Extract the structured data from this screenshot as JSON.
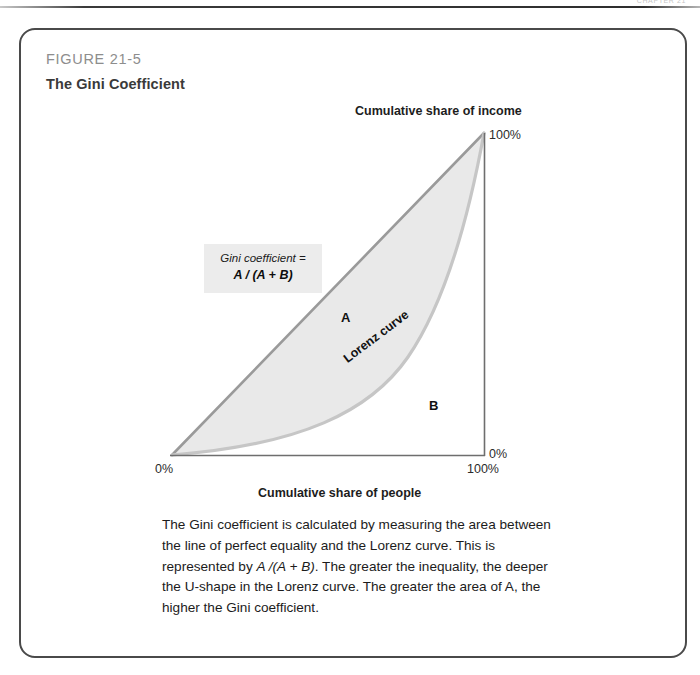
{
  "page": {
    "header_ghost": "CHAPTER 21"
  },
  "figure": {
    "number": "FIGURE 21-5",
    "title": "The Gini Coefficient",
    "caption": "The Gini coefficient  is calculated by measuring the area between the line of perfect equality and the Lorenz curve. This is represented by A /(A + B). The greater the inequality, the deeper the U-shape in the Lorenz curve. The greater the area of A, the higher the Gini coefficient."
  },
  "formula": {
    "label": "Gini coefficient =",
    "expression": "A / (A + B)"
  },
  "annotations": {
    "region_a": "A",
    "region_b": "B",
    "lorenz_curve": "Lorenz curve"
  },
  "colors": {
    "frame": "#4a4a4a",
    "figure_number": "#8d8d8d",
    "figure_title": "#3a3a3a",
    "region_a_fill": "#e9e9e9",
    "equality_line": "#9a9a9a",
    "lorenz_line": "#c4c4c4",
    "axis": "#6e6e6e",
    "formula_box": "#ececec"
  },
  "chart_data": {
    "type": "area",
    "title": "The Gini Coefficient",
    "xlabel": "Cumulative share of people",
    "ylabel": "Cumulative share of income",
    "xlim": [
      0,
      100
    ],
    "ylim": [
      0,
      100
    ],
    "grid": false,
    "legend": "none",
    "x_tick_labels": [
      "0%",
      "100%"
    ],
    "y_tick_labels": [
      "0%",
      "100%"
    ],
    "y_axis_position": "right",
    "series": [
      {
        "name": "Line of perfect equality",
        "x": [
          0,
          100
        ],
        "values": [
          0,
          100
        ]
      },
      {
        "name": "Lorenz curve",
        "x": [
          0,
          10,
          20,
          30,
          40,
          50,
          60,
          70,
          80,
          90,
          100
        ],
        "values": [
          0,
          1,
          2.5,
          5,
          8,
          13,
          20,
          30,
          45,
          66,
          100
        ]
      }
    ],
    "annotations": [
      {
        "text": "A",
        "x": 53,
        "y": 45,
        "description": "area between equality line and Lorenz curve"
      },
      {
        "text": "B",
        "x": 82,
        "y": 18,
        "description": "area beneath Lorenz curve"
      },
      {
        "text": "Lorenz curve",
        "x": 60,
        "y": 27,
        "rotation": -37
      },
      {
        "text": "Gini coefficient = A / (A + B)",
        "x": 13,
        "y": 66
      }
    ]
  }
}
